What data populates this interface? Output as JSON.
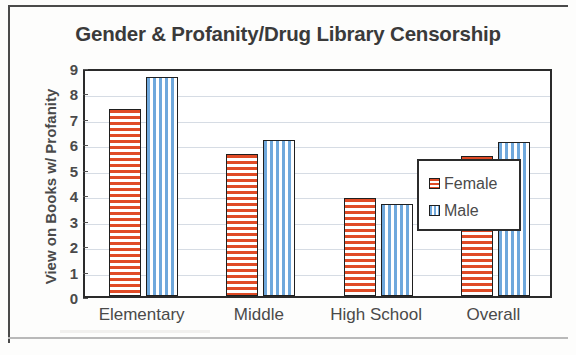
{
  "chart_data": {
    "type": "bar",
    "title": "Gender & Profanity/Drug Library Censorship",
    "xlabel": "",
    "ylabel": "View on Books w/ Profanity",
    "categories": [
      "Elementary",
      "Middle",
      "High School",
      "Overall"
    ],
    "series": [
      {
        "name": "Female",
        "color": "#e04b26",
        "pattern": "horizontal-stripes",
        "values": [
          7.35,
          5.6,
          3.85,
          5.5
        ]
      },
      {
        "name": "Male",
        "color": "#6fa8dc",
        "pattern": "vertical-stripes",
        "values": [
          8.6,
          6.15,
          3.6,
          6.05
        ]
      }
    ],
    "ylim": [
      0,
      9
    ],
    "y_ticks": [
      "0",
      "1",
      "2",
      "3",
      "4",
      "5",
      "6",
      "7",
      "8",
      "9"
    ],
    "grid": true,
    "legend_position": "inside-top-center"
  },
  "legend": {
    "entries": [
      {
        "label": "Female"
      },
      {
        "label": "Male"
      }
    ]
  }
}
